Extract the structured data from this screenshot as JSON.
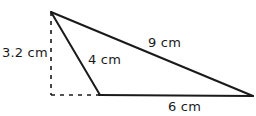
{
  "figure": {
    "kind": "geometry-triangle-diagram",
    "background_color": "#ffffff",
    "stroke_color": "#1a1a1a",
    "solid_stroke_width": 2,
    "dashed_stroke_width": 1.6,
    "dash_pattern": "4 5",
    "vertices": {
      "apex": {
        "name": "apex-vertex",
        "x": 51,
        "y": 12
      },
      "base_left": {
        "name": "base-left-vertex",
        "x": 100,
        "y": 95
      },
      "base_right": {
        "name": "base-right-vertex",
        "x": 253,
        "y": 96
      },
      "foot": {
        "name": "altitude-foot-point",
        "x": 51,
        "y": 95
      }
    },
    "solid_edges": [
      {
        "name": "edge-slant-4cm",
        "from": "apex",
        "to": "base_left",
        "measure": "4 cm"
      },
      {
        "name": "edge-slant-9cm",
        "from": "apex",
        "to": "base_right",
        "measure": "9 cm"
      },
      {
        "name": "edge-base-6cm",
        "from": "base_left",
        "to": "base_right",
        "measure": "6 cm"
      }
    ],
    "dashed_edges": [
      {
        "name": "altitude-dashed-line",
        "from": "apex",
        "to": "foot",
        "measure": "3.2 cm"
      },
      {
        "name": "base-extension-dashed-line",
        "from": "foot",
        "to": "base_left",
        "measure": ""
      }
    ],
    "labels": {
      "height": "3.2 cm",
      "side_4": "4 cm",
      "side_9": "9 cm",
      "base_6": "6 cm"
    }
  }
}
